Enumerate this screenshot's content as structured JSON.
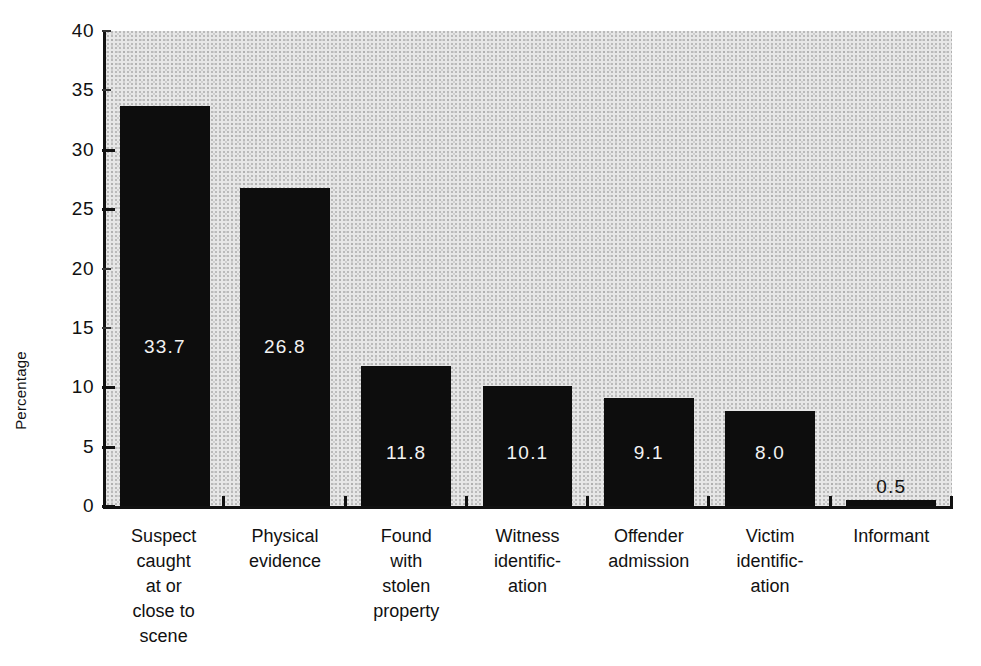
{
  "chart_data": {
    "type": "bar",
    "title": "",
    "subtitle": "",
    "xlabel": "",
    "ylabel": "Percentage",
    "ylim": [
      0,
      40
    ],
    "yticks": [
      0,
      5,
      10,
      15,
      20,
      25,
      30,
      35,
      40
    ],
    "ytick_labels": [
      "0",
      "5",
      "10",
      "15",
      "20",
      "25",
      "30",
      "35",
      "40"
    ],
    "grid": false,
    "legend": false,
    "categories": [
      "Suspect caught at or close to scene",
      "Physical evidence",
      "Found with stolen property",
      "Witness identific-ation",
      "Offender admission",
      "Victim identific-ation",
      "Informant"
    ],
    "category_lines": [
      [
        "Suspect",
        "caught",
        "at or",
        "close to",
        "scene"
      ],
      [
        "Physical",
        "evidence"
      ],
      [
        "Found",
        "with",
        "stolen",
        "property"
      ],
      [
        "Witness",
        "identific-",
        "ation"
      ],
      [
        "Offender",
        "admission"
      ],
      [
        "Victim",
        "identific-",
        "ation"
      ],
      [
        "Informant"
      ]
    ],
    "values": [
      33.7,
      26.8,
      11.8,
      10.1,
      9.1,
      8.0,
      0.5
    ],
    "value_labels": [
      "33.7",
      "26.8",
      "11.8",
      "10.1",
      "9.1",
      "8.0",
      "0.5"
    ],
    "bar_color": "#0d0d0d",
    "plot_background": "#e7e7e7",
    "value_label_color_inside": "#f2f2f2",
    "value_label_color_outside": "#111111"
  },
  "axis": {
    "y_title": "Percentage"
  }
}
